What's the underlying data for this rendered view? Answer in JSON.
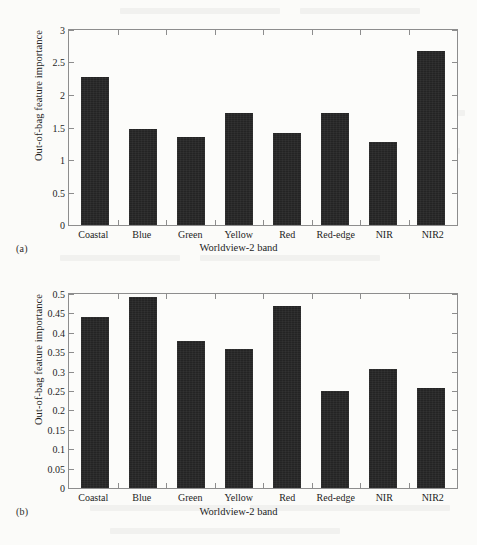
{
  "figure": {
    "panel_a_tag": "(a)",
    "panel_b_tag": "(b)",
    "bar_color": "#242424",
    "axis_color": "#8d8d8d",
    "background_color": "#fbfbf9"
  },
  "chart_data": [
    {
      "type": "bar",
      "panel": "(a)",
      "title": "",
      "xlabel": "Worldview-2 band",
      "ylabel": "Out-of-bag feature importance",
      "categories": [
        "Coastal",
        "Blue",
        "Green",
        "Yellow",
        "Red",
        "Red-edge",
        "NIR",
        "NIR2"
      ],
      "values": [
        2.27,
        1.48,
        1.35,
        1.72,
        1.41,
        1.72,
        1.28,
        2.68
      ],
      "ylim": [
        0,
        3
      ],
      "ytick_values": [
        0,
        0.5,
        1,
        1.5,
        2,
        2.5,
        3
      ],
      "ytick_labels": [
        "0",
        "0.5",
        "1",
        "1.5",
        "2",
        "2.5",
        "3"
      ],
      "grid": false,
      "legend": false
    },
    {
      "type": "bar",
      "panel": "(b)",
      "title": "",
      "xlabel": "Worldview-2 band",
      "ylabel": "Out-of-bag feature importance",
      "categories": [
        "Coastal",
        "Blue",
        "Green",
        "Yellow",
        "Red",
        "Red-edge",
        "NIR",
        "NIR2"
      ],
      "values": [
        0.441,
        0.493,
        0.379,
        0.359,
        0.469,
        0.249,
        0.307,
        0.259
      ],
      "ylim": [
        0,
        0.5
      ],
      "ytick_values": [
        0,
        0.05,
        0.1,
        0.15,
        0.2,
        0.25,
        0.3,
        0.35,
        0.4,
        0.45,
        0.5
      ],
      "ytick_labels": [
        "0",
        "0.05",
        "0.1",
        "0.15",
        "0.2",
        "0.25",
        "0.3",
        "0.35",
        "0.4",
        "0.45",
        "0.5"
      ],
      "grid": false,
      "legend": false
    }
  ]
}
